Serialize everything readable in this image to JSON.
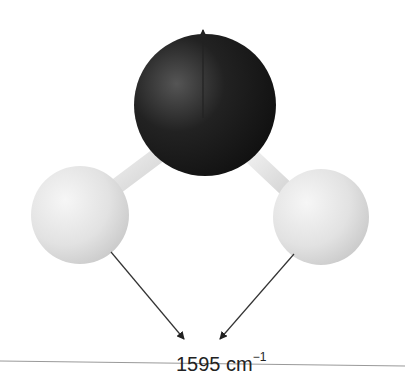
{
  "diagram": {
    "type": "molecular-vibration-mode",
    "molecule": "H2O (ball-and-stick)",
    "atoms": [
      {
        "name": "oxygen",
        "color": "#1e1e1e",
        "cx": 205,
        "cy": 100,
        "r": 73
      },
      {
        "name": "hydrogen-left",
        "color": "#e6e6e6",
        "cx": 80,
        "cy": 215,
        "r": 50
      },
      {
        "name": "hydrogen-right",
        "color": "#e6e6e6",
        "cx": 322,
        "cy": 217,
        "r": 50
      }
    ],
    "arrows": [
      {
        "name": "oxygen-displacement-arrow",
        "from": [
          203,
          98
        ],
        "to": [
          203,
          28
        ]
      },
      {
        "name": "hydrogen-left-displacement-arrow",
        "from": [
          111,
          252
        ],
        "to": [
          184,
          339
        ]
      },
      {
        "name": "hydrogen-right-displacement-arrow",
        "from": [
          294,
          254
        ],
        "to": [
          220,
          339
        ]
      }
    ],
    "label": {
      "value": "1595 cm",
      "exponent": "−1"
    }
  }
}
